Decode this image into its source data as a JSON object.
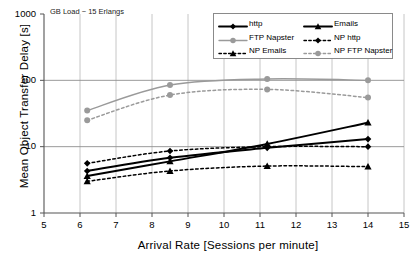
{
  "chart_data": {
    "type": "line",
    "title": "",
    "annotation": "GB Load ~ 15 Erlangs",
    "xlabel": "Arrival Rate [Sessions per minute]",
    "ylabel": "Mean Object Transfer Delay [s]",
    "xlim": [
      5,
      15
    ],
    "ylim": [
      1,
      1000
    ],
    "yscale": "log",
    "grid": true,
    "legend_position": "top-right",
    "xticks": [
      "5",
      "6",
      "7",
      "8",
      "9",
      "10",
      "11",
      "12",
      "13",
      "14",
      "15"
    ],
    "yticks": [
      "1",
      "10",
      "100",
      "1000"
    ],
    "x": [
      6.2,
      8.5,
      11.2,
      14.0
    ],
    "series": [
      {
        "name": "http",
        "color": "#000000",
        "style": "solid",
        "marker": "diamond",
        "values": [
          4.3,
          6.8,
          9.6,
          13.0
        ]
      },
      {
        "name": "Emails",
        "color": "#000000",
        "style": "solid",
        "marker": "triangle",
        "values": [
          3.6,
          6.0,
          11.0,
          23.0
        ]
      },
      {
        "name": "FTP Napster",
        "color": "#9a9a9a",
        "style": "solid",
        "marker": "circle",
        "values": [
          35.0,
          85.0,
          105.0,
          100.0
        ]
      },
      {
        "name": "NP http",
        "color": "#000000",
        "style": "dotted",
        "marker": "diamond",
        "values": [
          5.6,
          8.6,
          10.0,
          10.0
        ]
      },
      {
        "name": "NP Emails",
        "color": "#000000",
        "style": "dotted",
        "marker": "triangle",
        "values": [
          3.0,
          4.3,
          5.1,
          5.0
        ]
      },
      {
        "name": "NP FTP Napster",
        "color": "#9a9a9a",
        "style": "dotted",
        "marker": "circle",
        "values": [
          25.0,
          60.0,
          73.0,
          55.0
        ]
      }
    ]
  },
  "legend": {
    "entries": [
      {
        "label": "http"
      },
      {
        "label": "Emails"
      },
      {
        "label": "FTP Napster"
      },
      {
        "label": "NP http"
      },
      {
        "label": "NP Emails"
      },
      {
        "label": "NP FTP Napster"
      }
    ]
  }
}
